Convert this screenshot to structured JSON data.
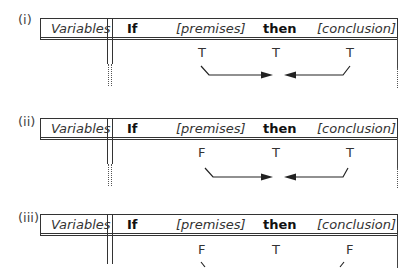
{
  "diagram": {
    "header": {
      "variables": "Variables",
      "if": "If",
      "premises": "[premises]",
      "then": "then",
      "conclusion": "[conclusion]"
    },
    "panels": [
      {
        "label": "(i)",
        "values": {
          "premises": "T",
          "then": "T",
          "conclusion": "T"
        },
        "arrows": true
      },
      {
        "label": "(ii)",
        "values": {
          "premises": "F",
          "then": "T",
          "conclusion": "T"
        },
        "arrows": true
      },
      {
        "label": "(iii)",
        "values": {
          "premises": "F",
          "then": "T",
          "conclusion": "F"
        },
        "arrows": true
      }
    ],
    "colors": {
      "line": "#333333",
      "text": "#222222"
    }
  }
}
